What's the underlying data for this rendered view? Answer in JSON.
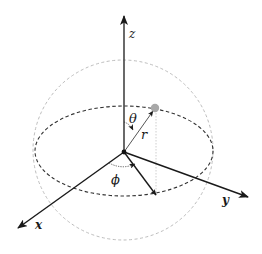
{
  "diagram": {
    "axes": {
      "x": {
        "label": "x"
      },
      "y": {
        "label": "y"
      },
      "z": {
        "label": "z"
      }
    },
    "symbols": {
      "theta": "θ",
      "phi": "ϕ",
      "r": "r"
    },
    "colors": {
      "axis": "#1a1a1a",
      "z_axis": "#444444",
      "sphere_outline": "#bbbbbb",
      "equator": "#333333",
      "point": "#a8a8a8",
      "r_vector": "#555555",
      "projection_guide": "#c8c8c8"
    }
  }
}
